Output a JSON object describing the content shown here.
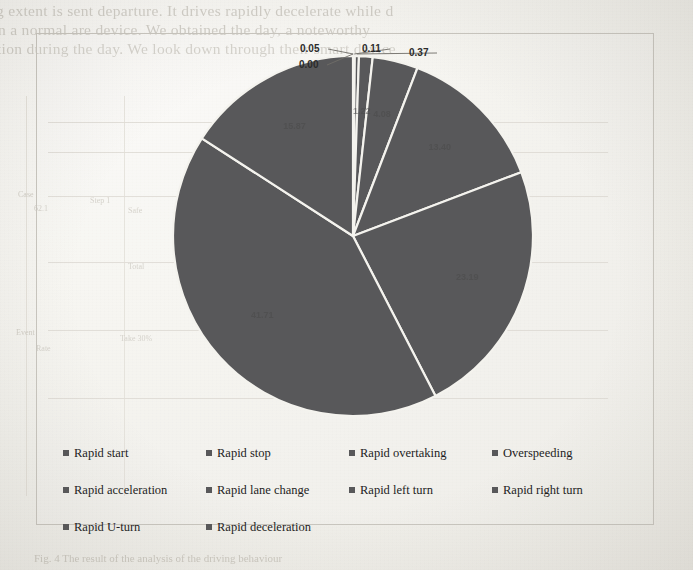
{
  "page": {
    "background_color": "#f3f2ee",
    "frame_border_color": "#c9c6bf"
  },
  "bleed_through": {
    "line1": "g extent is sent departure. It drives rapidly decelerate while d",
    "line2": "n a normal are device. We obtained the day, a noteworthy",
    "line3": "tion during the day. We look down through their smart device",
    "table_title": "Table Analysis",
    "cell_a1": "Case",
    "cell_a2": "Rate",
    "cell_b1": "62.1",
    "cell_b2": "Step 1",
    "cell_c1": "Safe",
    "cell_c2": "Take 30%",
    "cell_d1": "Event",
    "cell_d2": "Total",
    "footer": "Fig. 4 The result of the analysis of the driving behaviour"
  },
  "chart_data": {
    "type": "pie",
    "title": "",
    "legend_position": "bottom",
    "total": 100,
    "slice_color": "#58585a",
    "slice_border_color": "#f4f3ee",
    "categories": [
      "Rapid start",
      "Rapid stop",
      "Rapid overtaking",
      "Overspeeding",
      "Rapid acceleration",
      "Rapid lane change",
      "Rapid left turn",
      "Rapid right turn",
      "Rapid U-turn",
      "Rapid deceleration"
    ],
    "values": [
      0.0,
      0.05,
      0.11,
      0.37,
      1.22,
      4.08,
      13.4,
      23.19,
      41.71,
      15.87
    ],
    "labels": [
      "0.00",
      "0.05",
      "0.11",
      "0.37",
      "1.22",
      "4.08",
      "13.40",
      "23.19",
      "41.71",
      "15.87"
    ],
    "visible_labels": {
      "v0": "0.00",
      "v1": "0.05",
      "v2": "0.11",
      "v3": "0.37",
      "v4": "1.22",
      "v5": "4.08",
      "v6": "13.40",
      "v7": "23.19",
      "v8": "41.71",
      "v9": "15.87"
    }
  },
  "legend": {
    "items": [
      {
        "label": "Rapid start",
        "color": "#58585a"
      },
      {
        "label": "Rapid stop",
        "color": "#58585a"
      },
      {
        "label": "Rapid overtaking",
        "color": "#58585a"
      },
      {
        "label": "Overspeeding",
        "color": "#58585a"
      },
      {
        "label": "Rapid acceleration",
        "color": "#58585a"
      },
      {
        "label": "Rapid lane change",
        "color": "#58585a"
      },
      {
        "label": "Rapid left turn",
        "color": "#58585a"
      },
      {
        "label": "Rapid right turn",
        "color": "#58585a"
      },
      {
        "label": "Rapid U-turn",
        "color": "#58585a"
      },
      {
        "label": "Rapid deceleration",
        "color": "#58585a"
      }
    ]
  }
}
